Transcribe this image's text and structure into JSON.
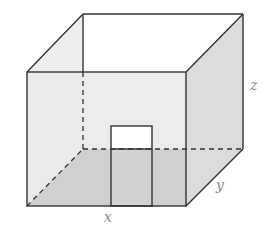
{
  "diagram": {
    "labels": {
      "x": "x",
      "y": "y",
      "z": "z"
    },
    "colors": {
      "edge": "#333333",
      "front_face": "#e8e8e8",
      "floor": "#c6c6c6",
      "right_face": "#dcdcdc",
      "back_face": "#ffffff",
      "door_opening": "#ffffff",
      "label": "#8a8a8a"
    },
    "vertices": {
      "front_top_left": [
        27,
        72
      ],
      "front_top_right": [
        186,
        72
      ],
      "front_bottom_left": [
        27,
        206
      ],
      "front_bottom_right": [
        186,
        206
      ],
      "back_top_left": [
        83,
        14
      ],
      "back_top_right": [
        243,
        14
      ],
      "back_bottom_left": [
        83,
        149
      ],
      "back_bottom_right": [
        243,
        149
      ]
    },
    "door": {
      "left": 111,
      "right": 152,
      "top": 126,
      "mid": 149,
      "bottom": 206
    }
  }
}
